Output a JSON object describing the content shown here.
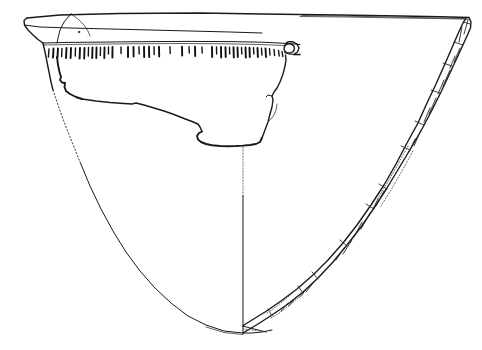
{
  "figure": {
    "kind": "archaeological-pottery-profile-drawing",
    "title": "",
    "caption": "",
    "background_color": "#ffffff",
    "ink_color": "#1a1a1a",
    "width_px": 482,
    "height_px": 350,
    "scale_bar": "",
    "label": ""
  },
  "drawing": {
    "vessel_type": "open conical bowl / truncated-cone vessel",
    "orientation": "profile section, left = exterior view, right = cut section",
    "centerline": {
      "x": 243,
      "top_y": 148,
      "dotted_to_y": 196,
      "bottom_y": 333,
      "style_upper": "dotted",
      "style_lower": "solid"
    },
    "rim": {
      "left_x": 27,
      "right_x": 469,
      "y": 18,
      "note": "horizontal rim line across full width"
    },
    "decoration": {
      "name": "incised comb / tick band below rim",
      "band_top_y": 47,
      "band_left_x": 47,
      "band_right_x": 286,
      "tick_count": 46,
      "tick_length_px": 11
    },
    "lug": {
      "name": "pierced lug / handle stub",
      "cx": 289,
      "cy": 48,
      "r": 5
    },
    "break_edge": {
      "name": "broken sherd edge",
      "from": "left wall at y=90",
      "to": "centerline at y=146"
    },
    "section": {
      "name": "wall cross-section hatching",
      "side": "right",
      "segment_count": 9,
      "has_dotted_reconstruction": true
    }
  },
  "colors": {
    "ink": "#1a1a1a",
    "ink_soft": "#3a3a3a",
    "dotted": "#444444",
    "paper": "#ffffff"
  }
}
